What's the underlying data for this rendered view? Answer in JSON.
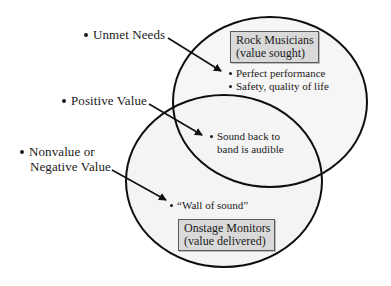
{
  "diagram": {
    "type": "venn",
    "sets": [
      {
        "id": "rock-musicians",
        "title": "Rock Musicians",
        "subtitle": "(value sought)",
        "items": [
          "Perfect performance",
          "Safety, quality of life"
        ]
      },
      {
        "id": "onstage-monitors",
        "title": "Onstage Monitors",
        "subtitle": "(value delivered)",
        "items": [
          "“Wall of sound”"
        ]
      }
    ],
    "intersection": {
      "items_line1": "Sound back to",
      "items_line2": "band is audible"
    },
    "callouts": [
      {
        "label": "Unmet Needs",
        "points_to": "rock-musicians-only"
      },
      {
        "label": "Positive Value",
        "points_to": "intersection"
      },
      {
        "label_line1": "Nonvalue or",
        "label_line2": "Negative Value",
        "points_to": "onstage-monitors-only"
      }
    ]
  },
  "colors": {
    "line": "#111111",
    "box_fill": "#d9d9d9",
    "box_border": "#5a5a5a",
    "region_shade": "#f2f2f2"
  }
}
